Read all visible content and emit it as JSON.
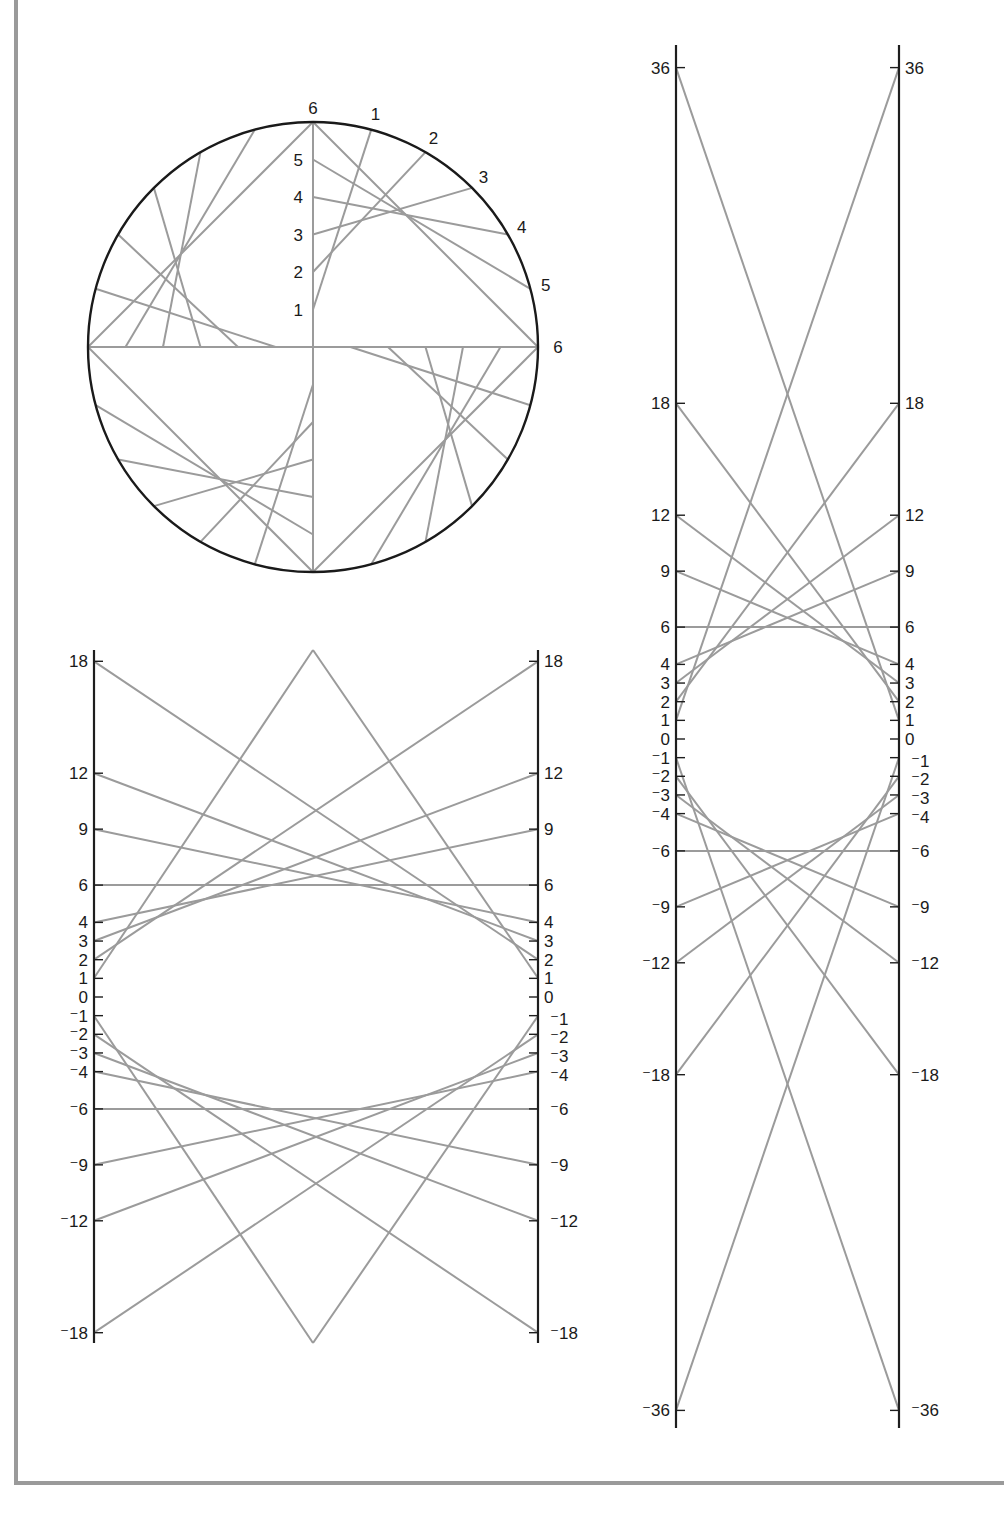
{
  "page": {
    "width": 990,
    "height": 1518,
    "background": "#ffffff",
    "frame_color": "#9a9a9a"
  },
  "colors": {
    "axis": "#1e1e1e",
    "thread": "#9b9b9b",
    "label": "#1a1a1a"
  },
  "circle_figure": {
    "title": "Circle envelope construction (four quadrants)",
    "center": [
      313,
      347
    ],
    "radius": 225,
    "divisions": 6,
    "radial_labels": [
      "1",
      "2",
      "3",
      "4",
      "5",
      "6"
    ],
    "arc_labels": [
      "1",
      "2",
      "3",
      "4",
      "5",
      "6"
    ],
    "quadrant_starts_deg": [
      180,
      90,
      0,
      270
    ]
  },
  "ellipse_figure": {
    "title": "Ellipse envelope between two parallel axes (product 36)",
    "left_axis_x": 94,
    "right_axis_x": 538,
    "axis_top": 650,
    "axis_bottom": 1343,
    "zero_y": 997,
    "unit_px": 18.65,
    "tick_values": [
      18,
      12,
      9,
      6,
      4,
      3,
      2,
      1,
      0,
      -1,
      -2,
      -3,
      -4,
      -6,
      -9,
      -12,
      -18
    ],
    "tick_labels": [
      "18",
      "12",
      "9",
      "6",
      "4",
      "3",
      "2",
      "1",
      "0",
      "⁻1",
      "⁻2",
      "⁻3",
      "⁻4",
      "⁻6",
      "⁻9",
      "⁻12",
      "⁻18"
    ],
    "pairs": [
      [
        18,
        2
      ],
      [
        12,
        3
      ],
      [
        9,
        4
      ],
      [
        6,
        6
      ],
      [
        4,
        9
      ],
      [
        3,
        12
      ],
      [
        2,
        18
      ],
      [
        -18,
        -2
      ],
      [
        -12,
        -3
      ],
      [
        -9,
        -4
      ],
      [
        -6,
        -6
      ],
      [
        -4,
        -9
      ],
      [
        -3,
        -12
      ],
      [
        -2,
        -18
      ]
    ],
    "apex_lines": [
      [
        [
          94,
          978
        ],
        [
          313,
          650
        ]
      ],
      [
        [
          538,
          978
        ],
        [
          313,
          650
        ]
      ],
      [
        [
          94,
          1016
        ],
        [
          313,
          1343
        ]
      ],
      [
        [
          538,
          1016
        ],
        [
          313,
          1343
        ]
      ]
    ]
  },
  "tall_figure": {
    "title": "Envelope between two parallel axes, range ±36",
    "left_axis_x": 676,
    "right_axis_x": 899,
    "axis_top": 45,
    "axis_bottom": 1428,
    "zero_y": 739,
    "unit_px": 18.65,
    "tick_values": [
      36,
      18,
      12,
      9,
      6,
      4,
      3,
      2,
      1,
      0,
      -1,
      -2,
      -3,
      -4,
      -6,
      -9,
      -12,
      -18,
      -36
    ],
    "tick_labels": [
      "36",
      "18",
      "12",
      "9",
      "6",
      "4",
      "3",
      "2",
      "1",
      "0",
      "⁻1",
      "⁻2",
      "⁻3",
      "⁻4",
      "⁻6",
      "⁻9",
      "⁻12",
      "⁻18",
      "⁻36"
    ],
    "pairs": [
      [
        36,
        1
      ],
      [
        18,
        2
      ],
      [
        12,
        3
      ],
      [
        9,
        4
      ],
      [
        6,
        6
      ],
      [
        4,
        9
      ],
      [
        3,
        12
      ],
      [
        2,
        18
      ],
      [
        1,
        36
      ],
      [
        -36,
        -1
      ],
      [
        -18,
        -2
      ],
      [
        -12,
        -3
      ],
      [
        -9,
        -4
      ],
      [
        -6,
        -6
      ],
      [
        -4,
        -9
      ],
      [
        -3,
        -12
      ],
      [
        -2,
        -18
      ],
      [
        -1,
        -36
      ]
    ]
  }
}
